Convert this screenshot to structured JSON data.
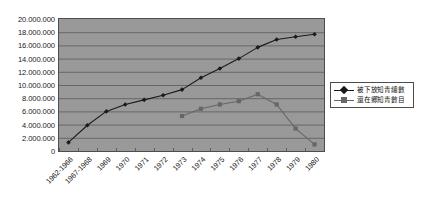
{
  "chart_data": {
    "type": "line",
    "title": "",
    "subtitle": "",
    "xlabel": "",
    "ylabel": "",
    "categories": [
      "1962-1966",
      "1967-1968",
      "1969",
      "1970",
      "1971",
      "1972",
      "1973",
      "1974",
      "1975",
      "1976",
      "1977",
      "1978",
      "1979",
      "1980"
    ],
    "x_tick_labels": [
      "1962-1966",
      "1967-1968",
      "1969",
      "1970",
      "1971",
      "1972",
      "1973",
      "1974",
      "1975",
      "1976",
      "1977",
      "1978",
      "1979",
      "1980"
    ],
    "y_tick_labels": [
      "20.000.000",
      "18.000.000",
      "16.000.000",
      "14.000.000",
      "12.000.000",
      "10.000.000",
      "8.000.000",
      "6.000.000",
      "4.000.000",
      "2.000.000",
      "0"
    ],
    "y_tick_values": [
      20000000,
      18000000,
      16000000,
      14000000,
      12000000,
      10000000,
      8000000,
      6000000,
      4000000,
      2000000,
      0
    ],
    "ylim": [
      0,
      20000000
    ],
    "y_tick_step": 2000000,
    "grid": "horizontal",
    "legend_position": "right",
    "plot_background": "#999999",
    "page_background": "#ffffff",
    "series": [
      {
        "name": "被下放知青總數",
        "marker": "diamond",
        "color": "#1a1a1a",
        "values": [
          1300000,
          3900000,
          6000000,
          7050000,
          7750000,
          8450000,
          9300000,
          11100000,
          12500000,
          14000000,
          15700000,
          16900000,
          17300000,
          17700000
        ]
      },
      {
        "name": "還在鄉知青數目",
        "marker": "square",
        "color": "#666666",
        "values": [
          null,
          null,
          null,
          null,
          null,
          null,
          5300000,
          6400000,
          7050000,
          7550000,
          8600000,
          7050000,
          3400000,
          1000000
        ]
      }
    ]
  },
  "legend": {
    "entries": [
      {
        "label": "被下放知青總數",
        "marker": "diamond",
        "color": "#1a1a1a"
      },
      {
        "label": "還在鄉知青數目",
        "marker": "square",
        "color": "#666666"
      }
    ]
  }
}
